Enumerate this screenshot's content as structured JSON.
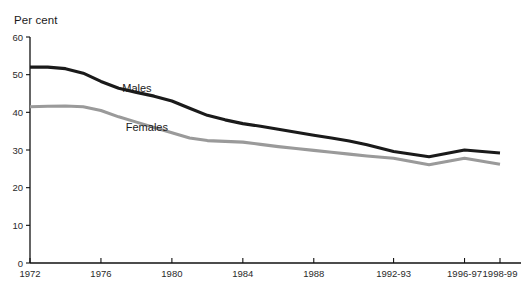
{
  "chart_data": {
    "type": "line",
    "title": "",
    "subtitle": "",
    "xlabel": "",
    "ylabel": "Per cent",
    "ylim": [
      0,
      60
    ],
    "yticks": [
      0,
      10,
      20,
      30,
      40,
      50,
      60
    ],
    "ytick_labels": [
      "0",
      "10",
      "20",
      "30",
      "40",
      "50",
      "60"
    ],
    "xtick_labels": [
      "1972",
      "1976",
      "1980",
      "1984",
      "1988",
      "1992-93",
      "1996-97",
      "1998-99"
    ],
    "xtick_values": [
      1972,
      1976,
      1980,
      1984,
      1988,
      1992.5,
      1996.5,
      1998.5
    ],
    "grid": false,
    "legend_position": "inline-annotations",
    "x": [
      1972,
      1973,
      1974,
      1975,
      1976,
      1977,
      1978,
      1979,
      1980,
      1981,
      1982,
      1983,
      1984,
      1985,
      1986,
      1987,
      1988,
      1989,
      1990,
      1991,
      1992.5,
      1994.5,
      1996.5,
      1998.5
    ],
    "series": [
      {
        "name": "Males",
        "color": "#1a1a1a",
        "label_x": 1977.2,
        "label_y": 45.5,
        "values": [
          52.0,
          52.0,
          51.6,
          50.4,
          48.2,
          46.4,
          45.3,
          44.3,
          43.0,
          41.1,
          39.2,
          38.0,
          37.0,
          36.3,
          35.5,
          34.7,
          33.9,
          33.2,
          32.4,
          31.4,
          29.6,
          28.2,
          30.0,
          29.2
        ]
      },
      {
        "name": "Females",
        "color": "#9a9a9a",
        "label_x": 1977.4,
        "label_y": 35.0,
        "values": [
          41.5,
          41.6,
          41.7,
          41.5,
          40.5,
          38.8,
          37.4,
          36.0,
          34.6,
          33.2,
          32.5,
          32.3,
          32.1,
          31.5,
          30.9,
          30.4,
          29.9,
          29.4,
          28.9,
          28.4,
          27.8,
          26.1,
          27.8,
          26.2
        ]
      }
    ]
  },
  "axis": {
    "unit_label": "Per cent"
  }
}
